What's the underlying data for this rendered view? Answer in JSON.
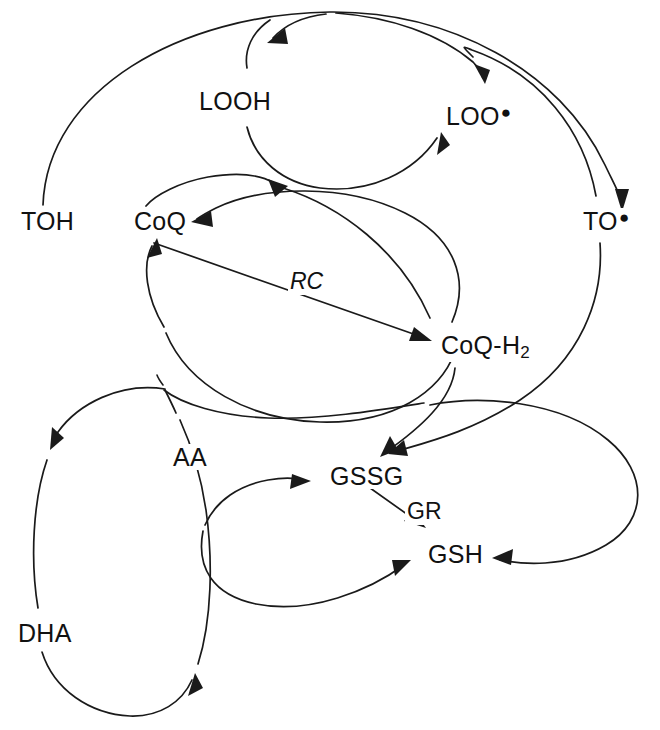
{
  "diagram": {
    "background_color": "#ffffff",
    "stroke_color": "#1a1a1a",
    "nodes": [
      {
        "id": "TOH",
        "label": "TOH",
        "radical": false,
        "x": 18,
        "y": 222
      },
      {
        "id": "LOOH",
        "label": "LOOH",
        "radical": false,
        "x": 196,
        "y": 88
      },
      {
        "id": "LOO",
        "label": "LOO",
        "radical": true,
        "x": 443,
        "y": 103
      },
      {
        "id": "TO",
        "label": "TO",
        "radical": true,
        "x": 580,
        "y": 222
      },
      {
        "id": "CoQ",
        "label": "CoQ",
        "radical": false,
        "x": 131,
        "y": 222
      },
      {
        "id": "CoQH2",
        "label": "CoQ-H",
        "sub": "2",
        "radical": false,
        "x": 438,
        "y": 332
      },
      {
        "id": "AA",
        "label": "AA",
        "radical": false,
        "x": 170,
        "y": 444
      },
      {
        "id": "DHA",
        "label": "DHA",
        "radical": false,
        "x": 15,
        "y": 620
      },
      {
        "id": "GSSG",
        "label": "GSSG",
        "radical": false,
        "x": 327,
        "y": 463
      },
      {
        "id": "GSH",
        "label": "GSH",
        "radical": false,
        "x": 425,
        "y": 541
      }
    ],
    "enzyme_labels": [
      {
        "id": "RC",
        "label": "RC",
        "italic": true,
        "x": 288,
        "y": 268
      },
      {
        "id": "GR",
        "label": "GR",
        "italic": false,
        "x": 405,
        "y": 498
      }
    ],
    "edges": [
      {
        "from": "TOH",
        "to": "TO",
        "style": "outer-arc-top"
      },
      {
        "from": "TO",
        "to": "LOO",
        "style": "arc"
      },
      {
        "from": "LOO",
        "to": "LOOH",
        "style": "arc-upper"
      },
      {
        "from": "LOOH",
        "to": "LOO",
        "style": "arc-lower"
      },
      {
        "from": "CoQ",
        "to": "LOOH",
        "style": "arc"
      },
      {
        "from": "CoQH2",
        "to": "CoQ",
        "style": "arc-upper"
      },
      {
        "from": "CoQ",
        "to": "CoQH2",
        "style": "straight",
        "label": "RC"
      },
      {
        "from": "AA",
        "to": "CoQ",
        "style": "arc-lower"
      },
      {
        "from": "CoQH2",
        "to": "GSSG",
        "style": "arc"
      },
      {
        "from": "TO",
        "to": "GSSG",
        "style": "arc"
      },
      {
        "from": "AA",
        "to": "DHA",
        "style": "ellipse-left"
      },
      {
        "from": "DHA",
        "to": "AA",
        "style": "ellipse-right"
      },
      {
        "from": "AA",
        "to": "GSSG",
        "style": "arc-upper"
      },
      {
        "from": "GSH",
        "to": "AA",
        "style": "arc-lower"
      },
      {
        "from": "GSSG",
        "to": "GSH",
        "style": "straight",
        "label": "GR"
      },
      {
        "from": "CoQH2",
        "to": "GSH",
        "style": "teardrop-right"
      }
    ]
  }
}
